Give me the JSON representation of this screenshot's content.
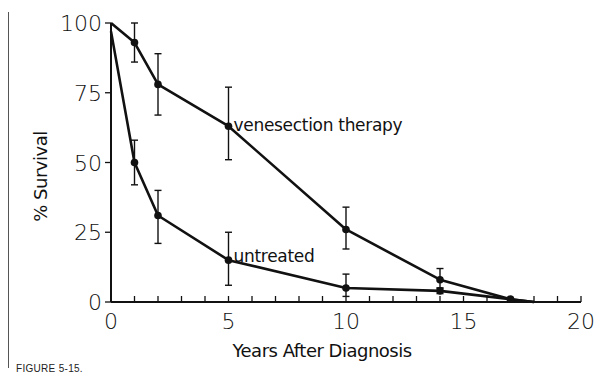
{
  "figure": {
    "caption": "FIGURE 5-15."
  },
  "chart_data": {
    "type": "line",
    "title": "",
    "xlabel": "Years After Diagnosis",
    "ylabel": "% Survival",
    "xlim": [
      0,
      20
    ],
    "ylim": [
      0,
      100
    ],
    "x_ticks": [
      0,
      5,
      10,
      15,
      20
    ],
    "x_tick_labels": [
      "0",
      "5",
      "10",
      "15",
      "20"
    ],
    "x_minor_tick_step": 1,
    "y_ticks": [
      0,
      25,
      50,
      75,
      100
    ],
    "y_tick_labels": [
      "0",
      "25",
      "50",
      "75",
      "100"
    ],
    "grid": false,
    "legend": "inline labels",
    "series": [
      {
        "name": "venesection therapy",
        "label_anchor": {
          "x": 5,
          "y": 63
        },
        "x": [
          0,
          1,
          2,
          5,
          10,
          14,
          17,
          18
        ],
        "values": [
          100,
          93,
          78,
          63,
          26,
          8,
          1,
          0
        ],
        "error_bars": [
          {
            "x": 1,
            "low": 86,
            "high": 100
          },
          {
            "x": 2,
            "low": 67,
            "high": 89
          },
          {
            "x": 5,
            "low": 51,
            "high": 77
          },
          {
            "x": 10,
            "low": 19,
            "high": 34
          },
          {
            "x": 14,
            "low": 5,
            "high": 12
          }
        ]
      },
      {
        "name": "untreated",
        "label_anchor": {
          "x": 5,
          "y": 15
        },
        "x": [
          0,
          1,
          2,
          5,
          10,
          14,
          17,
          18
        ],
        "values": [
          97,
          50,
          31,
          15,
          5,
          4,
          1,
          0
        ],
        "error_bars": [
          {
            "x": 1,
            "low": 42,
            "high": 58
          },
          {
            "x": 2,
            "low": 21,
            "high": 40
          },
          {
            "x": 5,
            "low": 6,
            "high": 25
          },
          {
            "x": 10,
            "low": 2,
            "high": 10
          },
          {
            "x": 14,
            "low": 3,
            "high": 5
          }
        ]
      }
    ]
  }
}
